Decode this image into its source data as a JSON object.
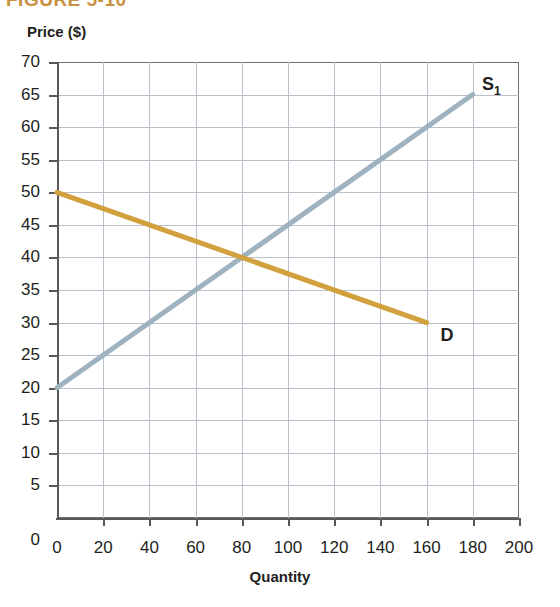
{
  "figure": {
    "caption": "FIGURE 5-10"
  },
  "chart_data": {
    "type": "line",
    "title": "",
    "xlabel": "Quantity",
    "ylabel": "Price ($)",
    "xlim": [
      0,
      200
    ],
    "ylim": [
      0,
      70
    ],
    "xticks": [
      0,
      20,
      40,
      60,
      80,
      100,
      120,
      140,
      160,
      180,
      200
    ],
    "yticks": [
      0,
      5,
      10,
      15,
      20,
      25,
      30,
      35,
      40,
      45,
      50,
      55,
      60,
      65,
      70
    ],
    "grid": true,
    "legend": "inline-labels",
    "series": [
      {
        "name": "S",
        "label": "S",
        "label_subscript": "1",
        "color": "#9fb2bf",
        "points": [
          [
            0,
            20
          ],
          [
            180,
            65
          ]
        ],
        "label_x": 184,
        "label_y": 66.5
      },
      {
        "name": "D",
        "label": "D",
        "label_subscript": "",
        "color": "#d2a13e",
        "points": [
          [
            0,
            50
          ],
          [
            160,
            30
          ]
        ],
        "label_x": 166,
        "label_y": 28
      }
    ],
    "annotations": [
      {
        "name": "equilibrium",
        "x": 80,
        "y": 40,
        "text": ""
      }
    ]
  },
  "colors": {
    "supply": "#9fb2bf",
    "demand": "#d2a13e",
    "grid": "#b9c2cc",
    "axis": "#58595b",
    "caption": "#c8913f"
  }
}
